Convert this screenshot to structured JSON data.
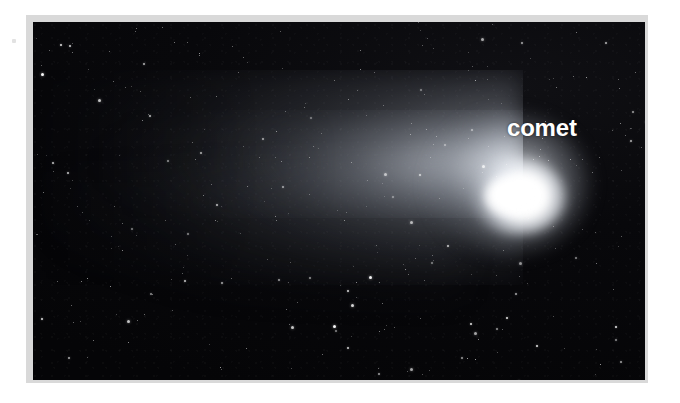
{
  "page": {
    "background_color": "#ffffff",
    "width": 680,
    "height": 403
  },
  "photo": {
    "alt_label": "comet-photograph",
    "frame_color": "#d9d9d9",
    "sky_color": "#060608",
    "frame": {
      "x": 26,
      "y": 15,
      "width": 622,
      "height": 368
    },
    "image_area": {
      "x": 33,
      "y": 22,
      "width": 612,
      "height": 358
    }
  },
  "annotations": {
    "comet_label": {
      "text": "comet",
      "color": "#ffffff",
      "font_size_px": 24,
      "font_weight": "bold",
      "x": 507,
      "y": 118
    }
  },
  "features": {
    "nucleus": {
      "name": "comet-nucleus",
      "color": "#ffffff",
      "center_x": 495,
      "center_y": 185
    },
    "coma": {
      "name": "comet-coma",
      "color": "#e6eaf0"
    },
    "tail": {
      "name": "comet-tail",
      "direction": "left",
      "color": "#8e949f"
    },
    "star_field": {
      "name": "star-field",
      "color": "#ffffff"
    }
  },
  "star_layers": [
    {
      "count": 140,
      "size": 1,
      "opacity": 0.55,
      "seed": 11
    },
    {
      "count": 95,
      "size": 1,
      "opacity": 0.8,
      "seed": 27
    },
    {
      "count": 48,
      "size": 2,
      "opacity": 0.9,
      "seed": 43
    },
    {
      "count": 14,
      "size": 3,
      "opacity": 1.0,
      "seed": 61
    }
  ]
}
